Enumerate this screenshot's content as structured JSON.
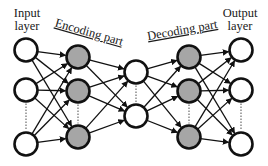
{
  "labels": {
    "input_line1": "Input",
    "input_line2": "layer",
    "output_line1": "Output",
    "output_line2": "layer",
    "encoding": "Encoding part",
    "decoding": "Decoding part"
  },
  "colors": {
    "stroke": "#111111",
    "hidden_fill": "#a6a6a6",
    "io_fill": "#ffffff"
  },
  "layers": [
    {
      "name": "input",
      "x": 26,
      "ys": [
        50,
        90,
        144
      ],
      "fill": "io"
    },
    {
      "name": "encoding",
      "x": 78,
      "ys": [
        57,
        91,
        137
      ],
      "fill": "hidden"
    },
    {
      "name": "code",
      "x": 136,
      "ys": [
        72,
        116
      ],
      "fill": "io"
    },
    {
      "name": "decoding",
      "x": 189,
      "ys": [
        57,
        91,
        137
      ],
      "fill": "hidden"
    },
    {
      "name": "output",
      "x": 241,
      "ys": [
        50,
        90,
        144
      ],
      "fill": "io"
    }
  ],
  "node_radius": 11.5
}
